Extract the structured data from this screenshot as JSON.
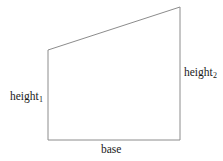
{
  "figure": {
    "name": "right-trapezoid-diagram",
    "background_color": "#ffffff",
    "stroke_color": "#8c8c8c",
    "stroke_width": 1,
    "text_color": "#1a1a1a",
    "shape": {
      "type": "trapezoid",
      "vertices": [
        {
          "name": "top-left",
          "x": 48,
          "y": 50
        },
        {
          "name": "top-right",
          "x": 180,
          "y": 7
        },
        {
          "name": "bottom-right",
          "x": 180,
          "y": 140
        },
        {
          "name": "bottom-left",
          "x": 48,
          "y": 140
        }
      ],
      "path": "M 48 50 L 180 7 L 180 140 L 48 140 Z",
      "fill": "none"
    },
    "labels": {
      "height1": {
        "text": "height",
        "subscript": "1"
      },
      "height2": {
        "text": "height",
        "subscript": "2"
      },
      "base": {
        "text": "base"
      }
    }
  }
}
